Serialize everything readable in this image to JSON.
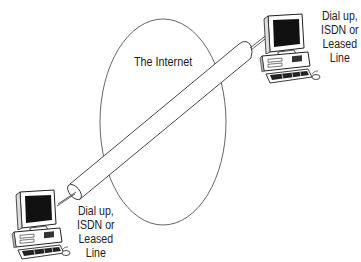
{
  "diagram": {
    "cloud_label": "The Internet",
    "endpoints": [
      {
        "position": "top-right",
        "device": "desktop-computer",
        "connection_label_lines": [
          "Dial up,",
          "ISDN or",
          "Leased",
          "Line"
        ]
      },
      {
        "position": "bottom-left",
        "device": "desktop-computer",
        "connection_label_lines": [
          "Dial up,",
          "ISDN or",
          "Leased",
          "Line"
        ]
      }
    ],
    "tunnel": "tube-connecting-both-endpoints-through-internet"
  }
}
